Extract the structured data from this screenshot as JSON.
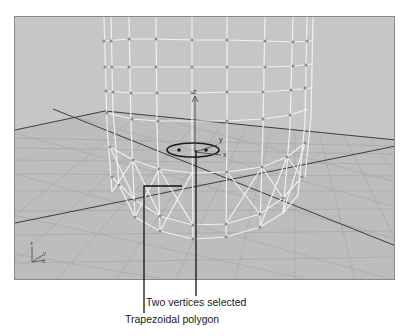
{
  "viewport": {
    "name": "Perspective viewport",
    "background": "#c4c4c4",
    "border": "#8a8a8a",
    "grid_color": "#9a9a9a",
    "grid_major_color": "#3a3a3a",
    "wire_color": "#f2f2f2",
    "vertex_color": "#8c8c8c",
    "gizmo": {
      "axis_z": "z",
      "axis_y": "y",
      "axis_x": "x",
      "selection": "ellipse"
    },
    "corner_axis": {
      "z": "z",
      "x": "x",
      "y": "y"
    }
  },
  "callouts": {
    "vertices": "Two vertices selected",
    "polygon": "Trapezoidal polygon"
  }
}
